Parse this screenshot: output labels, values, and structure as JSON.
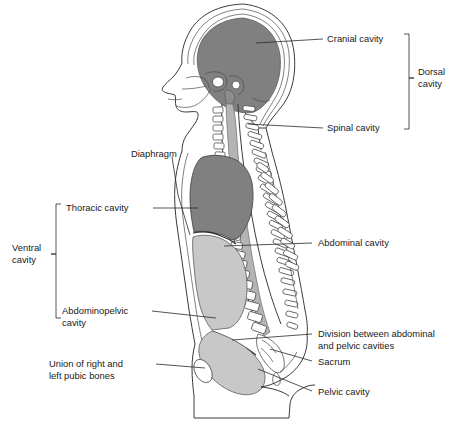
{
  "colors": {
    "dark_cavity": "#808080",
    "light_cavity": "#c8c8c8",
    "mid_cavity": "#b4b4b4",
    "outline": "#3a3a3a",
    "text": "#1a1a1a",
    "background": "#ffffff"
  },
  "labels": {
    "cranial_cavity": "Cranial cavity",
    "dorsal_cavity_line1": "Dorsal",
    "dorsal_cavity_line2": "cavity",
    "spinal_cavity": "Spinal cavity",
    "diaphragm": "Diaphragm",
    "thoracic_cavity": "Thoracic cavity",
    "ventral_cavity_line1": "Ventral",
    "ventral_cavity_line2": "cavity",
    "abdominal_cavity": "Abdominal cavity",
    "abdominopelvic_line1": "Abdominopelvic",
    "abdominopelvic_line2": "cavity",
    "division_line1": "Division between abdominal",
    "division_line2": "and pelvic cavities",
    "sacrum": "Sacrum",
    "pubic_union_line1": "Union of right and",
    "pubic_union_line2": "left pubic bones",
    "pelvic_cavity": "Pelvic cavity"
  },
  "regions": [
    {
      "name": "cranial-cavity",
      "fill": "dark",
      "label_key": "cranial_cavity"
    },
    {
      "name": "spinal-cavity",
      "fill": "mid",
      "label_key": "spinal_cavity"
    },
    {
      "name": "thoracic-cavity",
      "fill": "dark",
      "label_key": "thoracic_cavity"
    },
    {
      "name": "abdominal-cavity",
      "fill": "light",
      "label_key": "abdominal_cavity"
    },
    {
      "name": "pelvic-cavity",
      "fill": "light",
      "label_key": "pelvic_cavity"
    }
  ],
  "brackets": [
    {
      "name": "dorsal-cavity-bracket",
      "groups": [
        "cranial_cavity",
        "spinal_cavity"
      ]
    },
    {
      "name": "ventral-cavity-bracket",
      "groups": [
        "thoracic_cavity",
        "abdominopelvic_cavity"
      ]
    }
  ]
}
